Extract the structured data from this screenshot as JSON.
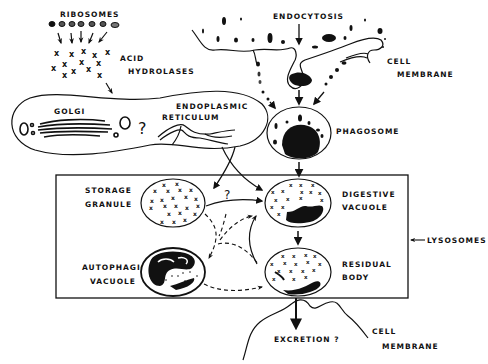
{
  "diagram": {
    "type": "biological-process-diagram",
    "labels": {
      "ribosomes": "RIBOSOMES",
      "acid_hydrolases_1": "ACID",
      "acid_hydrolases_2": "HYDROLASES",
      "golgi": "GOLGI",
      "er_1": "ENDOPLASMIC",
      "er_2": "RETICULUM",
      "golgi_question": "?",
      "endocytosis": "ENDOCYTOSIS",
      "cell_membrane_top_1": "CELL",
      "cell_membrane_top_2": "MEMBRANE",
      "phagosome": "PHAGOSOME",
      "storage_granule_1": "STORAGE",
      "storage_granule_2": "GRANULE",
      "center_question": "?",
      "digestive_vacuole_1": "DIGESTIVE",
      "digestive_vacuole_2": "VACUOLE",
      "lysosomes": "LYSOSOMES",
      "autophagic_vacuole_1": "AUTOPHAGIC",
      "autophagic_vacuole_2": "VACUOLE",
      "residual_body_1": "RESIDUAL",
      "residual_body_2": "BODY",
      "excretion": "EXCRETION ?",
      "cell_membrane_bottom_1": "CELL",
      "cell_membrane_bottom_2": "MEMBRANE"
    },
    "nodes": [
      {
        "id": "ribosomes",
        "label": "Ribosomes"
      },
      {
        "id": "acid_hydrolases",
        "label": "Acid Hydrolases"
      },
      {
        "id": "golgi",
        "label": "Golgi"
      },
      {
        "id": "er",
        "label": "Endoplasmic Reticulum"
      },
      {
        "id": "endocytosis",
        "label": "Endocytosis"
      },
      {
        "id": "phagosome",
        "label": "Phagosome"
      },
      {
        "id": "storage_granule",
        "label": "Storage Granule"
      },
      {
        "id": "digestive_vacuole",
        "label": "Digestive Vacuole"
      },
      {
        "id": "autophagic_vacuole",
        "label": "Autophagic Vacuole"
      },
      {
        "id": "residual_body",
        "label": "Residual Body"
      },
      {
        "id": "lysosomes_group",
        "label": "Lysosomes"
      },
      {
        "id": "excretion",
        "label": "Excretion ?"
      }
    ],
    "edges": [
      {
        "from": "ribosomes",
        "to": "acid_hydrolases",
        "style": "solid"
      },
      {
        "from": "acid_hydrolases",
        "to": "golgi",
        "style": "solid"
      },
      {
        "from": "golgi",
        "to": "storage_granule",
        "style": "solid"
      },
      {
        "from": "golgi",
        "to": "digestive_vacuole",
        "style": "solid"
      },
      {
        "from": "endocytosis",
        "to": "phagosome",
        "style": "solid"
      },
      {
        "from": "phagosome",
        "to": "digestive_vacuole",
        "style": "solid"
      },
      {
        "from": "storage_granule",
        "to": "digestive_vacuole",
        "style": "solid"
      },
      {
        "from": "storage_granule",
        "to": "autophagic_vacuole",
        "style": "dashed"
      },
      {
        "from": "autophagic_vacuole",
        "to": "digestive_vacuole",
        "style": "dashed"
      },
      {
        "from": "autophagic_vacuole",
        "to": "residual_body",
        "style": "dashed"
      },
      {
        "from": "residual_body",
        "to": "digestive_vacuole",
        "style": "solid"
      },
      {
        "from": "digestive_vacuole",
        "to": "residual_body",
        "style": "solid"
      },
      {
        "from": "residual_body",
        "to": "excretion",
        "style": "solid"
      }
    ]
  }
}
